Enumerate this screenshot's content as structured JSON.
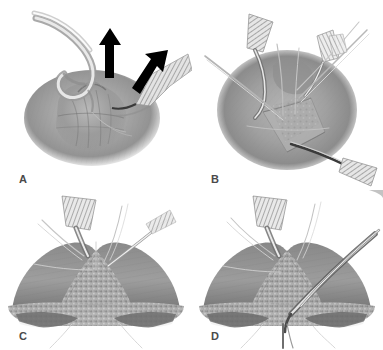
{
  "figure": {
    "type": "surgical-illustration-figure",
    "background_color": "#ffffff",
    "layout": "2x2 grid of grayscale medical illustration panels",
    "panel_count": 4
  },
  "panels": [
    {
      "id": "A",
      "label": "A",
      "position": "top-left",
      "description": "Surgical field showing a rounded tissue mass being elevated; a curved hook retractor pulls tissue upward at left and a ribbed retractor blade lifts tissue at right. Two solid black directional arrows indicate the direction of traction.",
      "annotations": [
        "arrow-up",
        "arrow-up-right"
      ],
      "instruments": [
        "curved-hook-retractor",
        "ribbed-retractor-blade"
      ],
      "arrow_color": "#000000",
      "tissue_tone": "#9d9d9d"
    },
    {
      "id": "B",
      "label": "B",
      "position": "top-right",
      "description": "Opened surgical field with a triangular flap reflected downward; multiple hatched retractor blades and fine suture needles hold the exposure open.",
      "annotations": [],
      "instruments": [
        "hatched-retractor-blade",
        "suture-needle",
        "forceps"
      ],
      "tissue_tone": "#9d9d9d"
    },
    {
      "id": "C",
      "label": "C",
      "position": "bottom-left",
      "description": "Close-up cross-sectional view of an arch-shaped anatomical structure with mottled granular tissue; a hatched spatula retractor from above and a fine probe from the right enter the field.",
      "annotations": [],
      "instruments": [
        "hatched-spatula-retractor",
        "fine-probe",
        "suture-thread"
      ],
      "tissue_tone": "#8f8f8f"
    },
    {
      "id": "D",
      "label": "D",
      "position": "bottom-right",
      "description": "Same arch-shaped structure as panel C with an additional elongated instrument passed obliquely from the upper right and a suture exiting below the midline.",
      "annotations": [],
      "instruments": [
        "hatched-spatula-retractor",
        "oblique-instrument",
        "suture-thread"
      ],
      "tissue_tone": "#8f8f8f"
    }
  ],
  "colors": {
    "background": "#ffffff",
    "ink_dark": "#3f3f3f",
    "tissue_mid": "#9b9b9b",
    "tissue_light": "#cdcdcd",
    "tissue_dark": "#6e6e6e",
    "arrow": "#000000",
    "label": "#4a4a4a"
  }
}
